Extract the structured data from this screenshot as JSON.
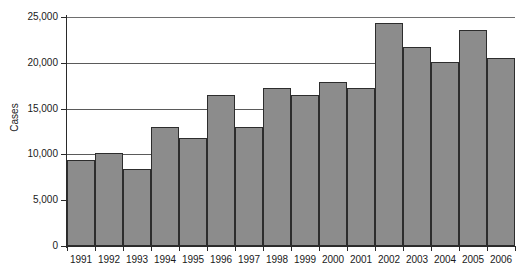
{
  "chart_data": {
    "type": "bar",
    "title": "",
    "xlabel": "",
    "ylabel": "Cases",
    "ylim": [
      0,
      25000
    ],
    "ytick_labels": [
      "25,000",
      "20,000",
      "15,000",
      "10,000",
      "5,000",
      "0"
    ],
    "ytick_values": [
      25000,
      20000,
      15000,
      10000,
      5000,
      0
    ],
    "grid": "horizontal",
    "legend": "none",
    "categories": [
      "1991",
      "1992",
      "1993",
      "1994",
      "1995",
      "1996",
      "1997",
      "1998",
      "1999",
      "2000",
      "2001",
      "2002",
      "2003",
      "2004",
      "2005",
      "2006"
    ],
    "values": [
      9400,
      10200,
      8400,
      13000,
      11800,
      16500,
      13000,
      17200,
      16500,
      17900,
      17200,
      24300,
      21700,
      20100,
      23600,
      20500
    ],
    "series": [
      {
        "name": "Cases",
        "values": [
          9400,
          10200,
          8400,
          13000,
          11800,
          16500,
          13000,
          17200,
          16500,
          17900,
          17200,
          24300,
          21700,
          20100,
          23600,
          20500
        ]
      }
    ],
    "colors": {
      "bar_fill": "#8c8c8c",
      "bar_stroke": "#2d2d2d",
      "gridline": "#5a5a5a",
      "axis": "#2a2a2a",
      "text": "#1a1a1a",
      "background": "#ffffff"
    }
  }
}
